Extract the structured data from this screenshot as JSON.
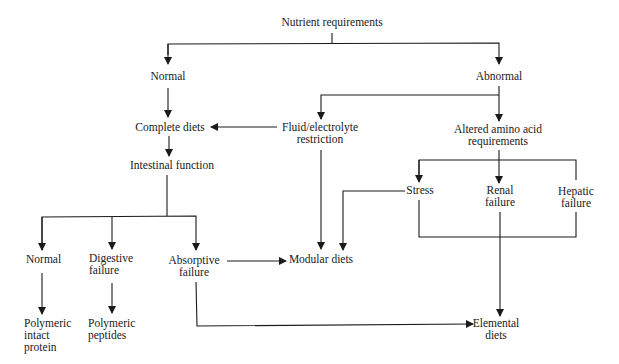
{
  "diagram": {
    "type": "flowchart",
    "root": "Nutrient requirements",
    "nodes": {
      "nutrient_requirements": {
        "lines": [
          "Nutrient requirements"
        ]
      },
      "normal_top": {
        "lines": [
          "Normal"
        ]
      },
      "abnormal": {
        "lines": [
          "Abnormal"
        ]
      },
      "complete_diets": {
        "lines": [
          "Complete diets"
        ]
      },
      "fluid_electrolyte": {
        "lines": [
          "Fluid/electrolyte",
          "restriction"
        ]
      },
      "altered_amino": {
        "lines": [
          "Altered amino acid",
          "requirements"
        ]
      },
      "intestinal_function": {
        "lines": [
          "Intestinal function"
        ]
      },
      "normal_bottom": {
        "lines": [
          "Normal"
        ]
      },
      "digestive_failure": {
        "lines": [
          "Digestive",
          "failure"
        ]
      },
      "absorptive_failure": {
        "lines": [
          "Absorptive",
          "failure"
        ]
      },
      "modular_diets": {
        "lines": [
          "Modular diets"
        ]
      },
      "stress": {
        "lines": [
          "Stress"
        ]
      },
      "renal_failure": {
        "lines": [
          "Renal",
          "failure"
        ]
      },
      "hepatic_failure": {
        "lines": [
          "Hepatic",
          "failure"
        ]
      },
      "polymeric_intact": {
        "lines": [
          "Polymeric",
          "intact",
          "protein"
        ]
      },
      "polymeric_peptides": {
        "lines": [
          "Polymeric",
          "peptides"
        ]
      },
      "elemental_diets": {
        "lines": [
          "Elemental",
          "diets"
        ]
      }
    },
    "edges": [
      [
        "Nutrient requirements",
        "Normal"
      ],
      [
        "Nutrient requirements",
        "Abnormal"
      ],
      [
        "Normal",
        "Complete diets"
      ],
      [
        "Abnormal",
        "Fluid/electrolyte restriction"
      ],
      [
        "Abnormal",
        "Altered amino acid requirements"
      ],
      [
        "Fluid/electrolyte restriction",
        "Complete diets"
      ],
      [
        "Fluid/electrolyte restriction",
        "Modular diets"
      ],
      [
        "Complete diets",
        "Intestinal function"
      ],
      [
        "Intestinal function",
        "Normal"
      ],
      [
        "Intestinal function",
        "Digestive failure"
      ],
      [
        "Intestinal function",
        "Absorptive failure"
      ],
      [
        "Normal",
        "Polymeric intact protein"
      ],
      [
        "Digestive failure",
        "Polymeric peptides"
      ],
      [
        "Absorptive failure",
        "Modular diets"
      ],
      [
        "Absorptive failure",
        "Elemental diets"
      ],
      [
        "Altered amino acid requirements",
        "Stress"
      ],
      [
        "Altered amino acid requirements",
        "Renal failure"
      ],
      [
        "Altered amino acid requirements",
        "Hepatic failure"
      ],
      [
        "Stress",
        "Modular diets"
      ],
      [
        "Stress / Renal failure / Hepatic failure",
        "Elemental diets"
      ]
    ],
    "colors": {
      "line": "#1a1a1a",
      "text": "#1a1a1a",
      "background": "#ffffff"
    }
  }
}
